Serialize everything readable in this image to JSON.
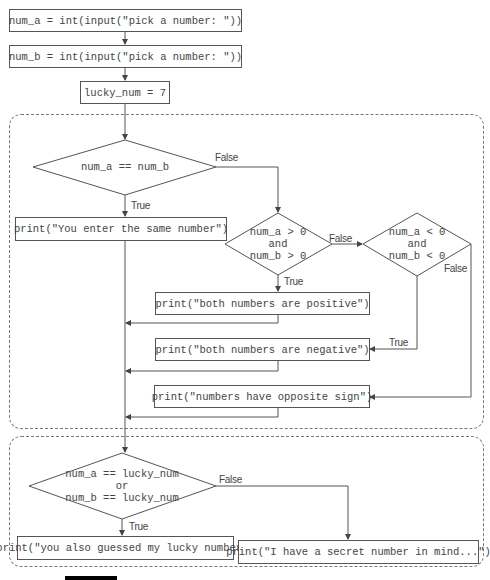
{
  "colors": {
    "stroke": "#555555",
    "text": "#444444",
    "container_border": "#777777"
  },
  "steps": {
    "input_a": "num_a = int(input(\"pick a number: \"))",
    "input_b": "num_b = int(input(\"pick a number: \"))",
    "lucky": "lucky_num = 7"
  },
  "group1": {
    "decision_equal": "num_a == num_b",
    "print_same": "print(\"You enter the same number\")",
    "decision_positive": "num_a > 0\nand\nnum_b > 0",
    "decision_negative": "num_a < 0\nand\nnum_b < 0",
    "print_positive": "print(\"both numbers are positive\")",
    "print_negative": "print(\"both numbers are negative\")",
    "print_opposite": "print(\"numbers have opposite sign\")"
  },
  "group2": {
    "decision_lucky": "num_a == lucky_num\nor\nnum_b == lucky_num",
    "print_lucky": "print(\"you also guessed my lucky number\")",
    "print_secret": "print(\"I have a secret number in mind...\")"
  },
  "labels": {
    "true": "True",
    "false": "False"
  }
}
